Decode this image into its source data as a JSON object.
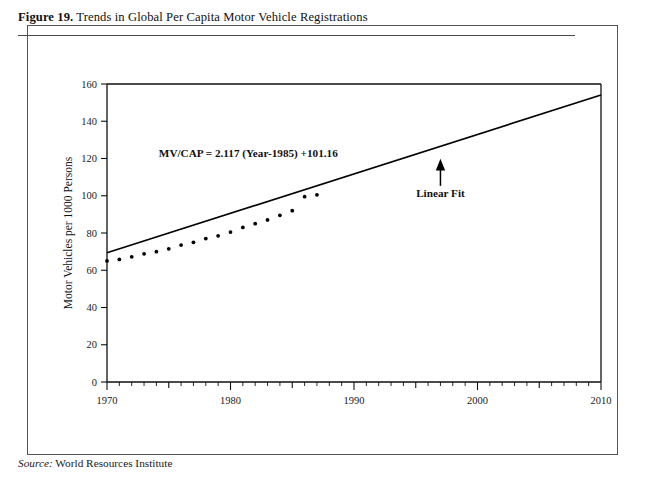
{
  "figure": {
    "number_label": "Figure 19.",
    "caption": " Trends in Global Per Capita Motor Vehicle Registrations",
    "source_label": "Source:",
    "source_text": " World Resources Institute"
  },
  "chart_data": {
    "type": "scatter",
    "title": "Trends in Global Per Capita Motor Vehicle Registrations",
    "xlabel": "",
    "ylabel": "Motor Vehicles per 1000 Persons",
    "xlim": [
      1970,
      2010
    ],
    "ylim": [
      0,
      160
    ],
    "xticks": [
      1970,
      1980,
      1990,
      2000,
      2010
    ],
    "xtick_labels": [
      "1970",
      "1980",
      "1990",
      "2000",
      "2010"
    ],
    "xminor_step": 1,
    "xmajor_minor_step": 5,
    "yticks": [
      0,
      20,
      40,
      60,
      80,
      100,
      120,
      140,
      160
    ],
    "ytick_labels": [
      "0",
      "20",
      "40",
      "60",
      "80",
      "100",
      "120",
      "140",
      "160"
    ],
    "grid": false,
    "legend": false,
    "series": [
      {
        "name": "Motor vehicle registrations per 1000 persons",
        "marker": "dot",
        "x": [
          1970,
          1971,
          1972,
          1973,
          1974,
          1975,
          1976,
          1977,
          1978,
          1979,
          1980,
          1981,
          1982,
          1983,
          1984,
          1985,
          1986,
          1987
        ],
        "values": [
          65.0,
          65.8,
          67.2,
          68.8,
          70.0,
          71.5,
          73.5,
          75.0,
          77.0,
          78.5,
          80.5,
          83.0,
          85.0,
          87.0,
          89.5,
          92.0,
          99.5,
          100.5
        ]
      },
      {
        "name": "Linear Fit",
        "marker": "line",
        "x": [
          1970,
          2010
        ],
        "values": [
          69.4,
          154.1
        ]
      }
    ],
    "annotations": [
      {
        "name": "equation",
        "text": "MV/CAP = 2.117 (Year-1985) +101.16",
        "x": 1974.2,
        "y": 121.0
      },
      {
        "name": "linear-fit-label",
        "text": "Linear Fit",
        "x": 1997.0,
        "y": 108.0
      }
    ],
    "fit": {
      "equation": "MV/CAP = 2.117 (Year-1985) +101.16",
      "slope": 2.117,
      "intercept": 101.16,
      "center_year": 1985,
      "label": "Linear Fit"
    },
    "colors": {
      "line": "#000000",
      "marker": "#000000",
      "axis": "#111111",
      "background": "#ffffff"
    }
  }
}
